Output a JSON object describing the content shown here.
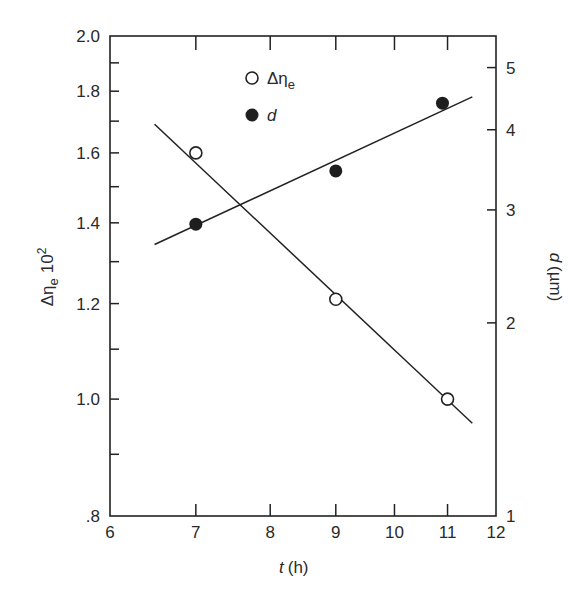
{
  "chart_data": {
    "type": "scatter",
    "title": "",
    "xlabel": "t (h)",
    "xlabel_var": "t",
    "xlabel_unit": "(h)",
    "ylabel_left": "Δη_e 10^2",
    "ylabel_left_parts": {
      "base": "Δη",
      "sub": "e",
      "factor": "10",
      "exp": "2"
    },
    "ylabel_right": "d (µm)",
    "ylabel_right_parts": {
      "var": "d",
      "unit": "(µm)"
    },
    "x_scale": "log",
    "y_left_scale": "log",
    "y_right_scale": "log",
    "xlim": [
      6,
      12
    ],
    "ylim_left": [
      0.8,
      2.0
    ],
    "ylim_right": [
      1,
      5.6
    ],
    "x_ticks": [
      6,
      7,
      8,
      9,
      10,
      11,
      12
    ],
    "x_tick_labels": [
      "6",
      "7",
      "8",
      "9",
      "10",
      "11",
      "12"
    ],
    "y_left_ticks": [
      0.8,
      1.0,
      1.2,
      1.4,
      1.6,
      1.8,
      2.0
    ],
    "y_left_tick_labels": [
      ".8",
      "1.0",
      "1.2",
      "1.4",
      "1.6",
      "1.8",
      "2.0"
    ],
    "y_left_minor_ticks": [
      0.9,
      1.1,
      1.3,
      1.5,
      1.7,
      1.9
    ],
    "y_right_ticks": [
      1,
      2,
      3,
      4,
      5
    ],
    "y_right_tick_labels": [
      "1",
      "2",
      "3",
      "4",
      "5"
    ],
    "grid": false,
    "legend_position": "upper-center-inside",
    "series": [
      {
        "name": "Δη_e",
        "legend_label": "Δη",
        "legend_sub": "e",
        "marker": "open-circle",
        "axis": "left",
        "x": [
          7,
          9,
          11
        ],
        "y": [
          1.6,
          1.21,
          1.0
        ],
        "fit_line": {
          "x": [
            6.5,
            11.5
          ],
          "y": [
            1.69,
            0.955
          ]
        }
      },
      {
        "name": "d",
        "legend_label": "d",
        "marker": "filled-circle",
        "axis": "right",
        "x": [
          7,
          9,
          10.9
        ],
        "y": [
          2.85,
          3.45,
          4.4
        ],
        "fit_line": {
          "x": [
            6.5,
            11.5
          ],
          "y": [
            2.65,
            4.5
          ]
        }
      }
    ]
  }
}
